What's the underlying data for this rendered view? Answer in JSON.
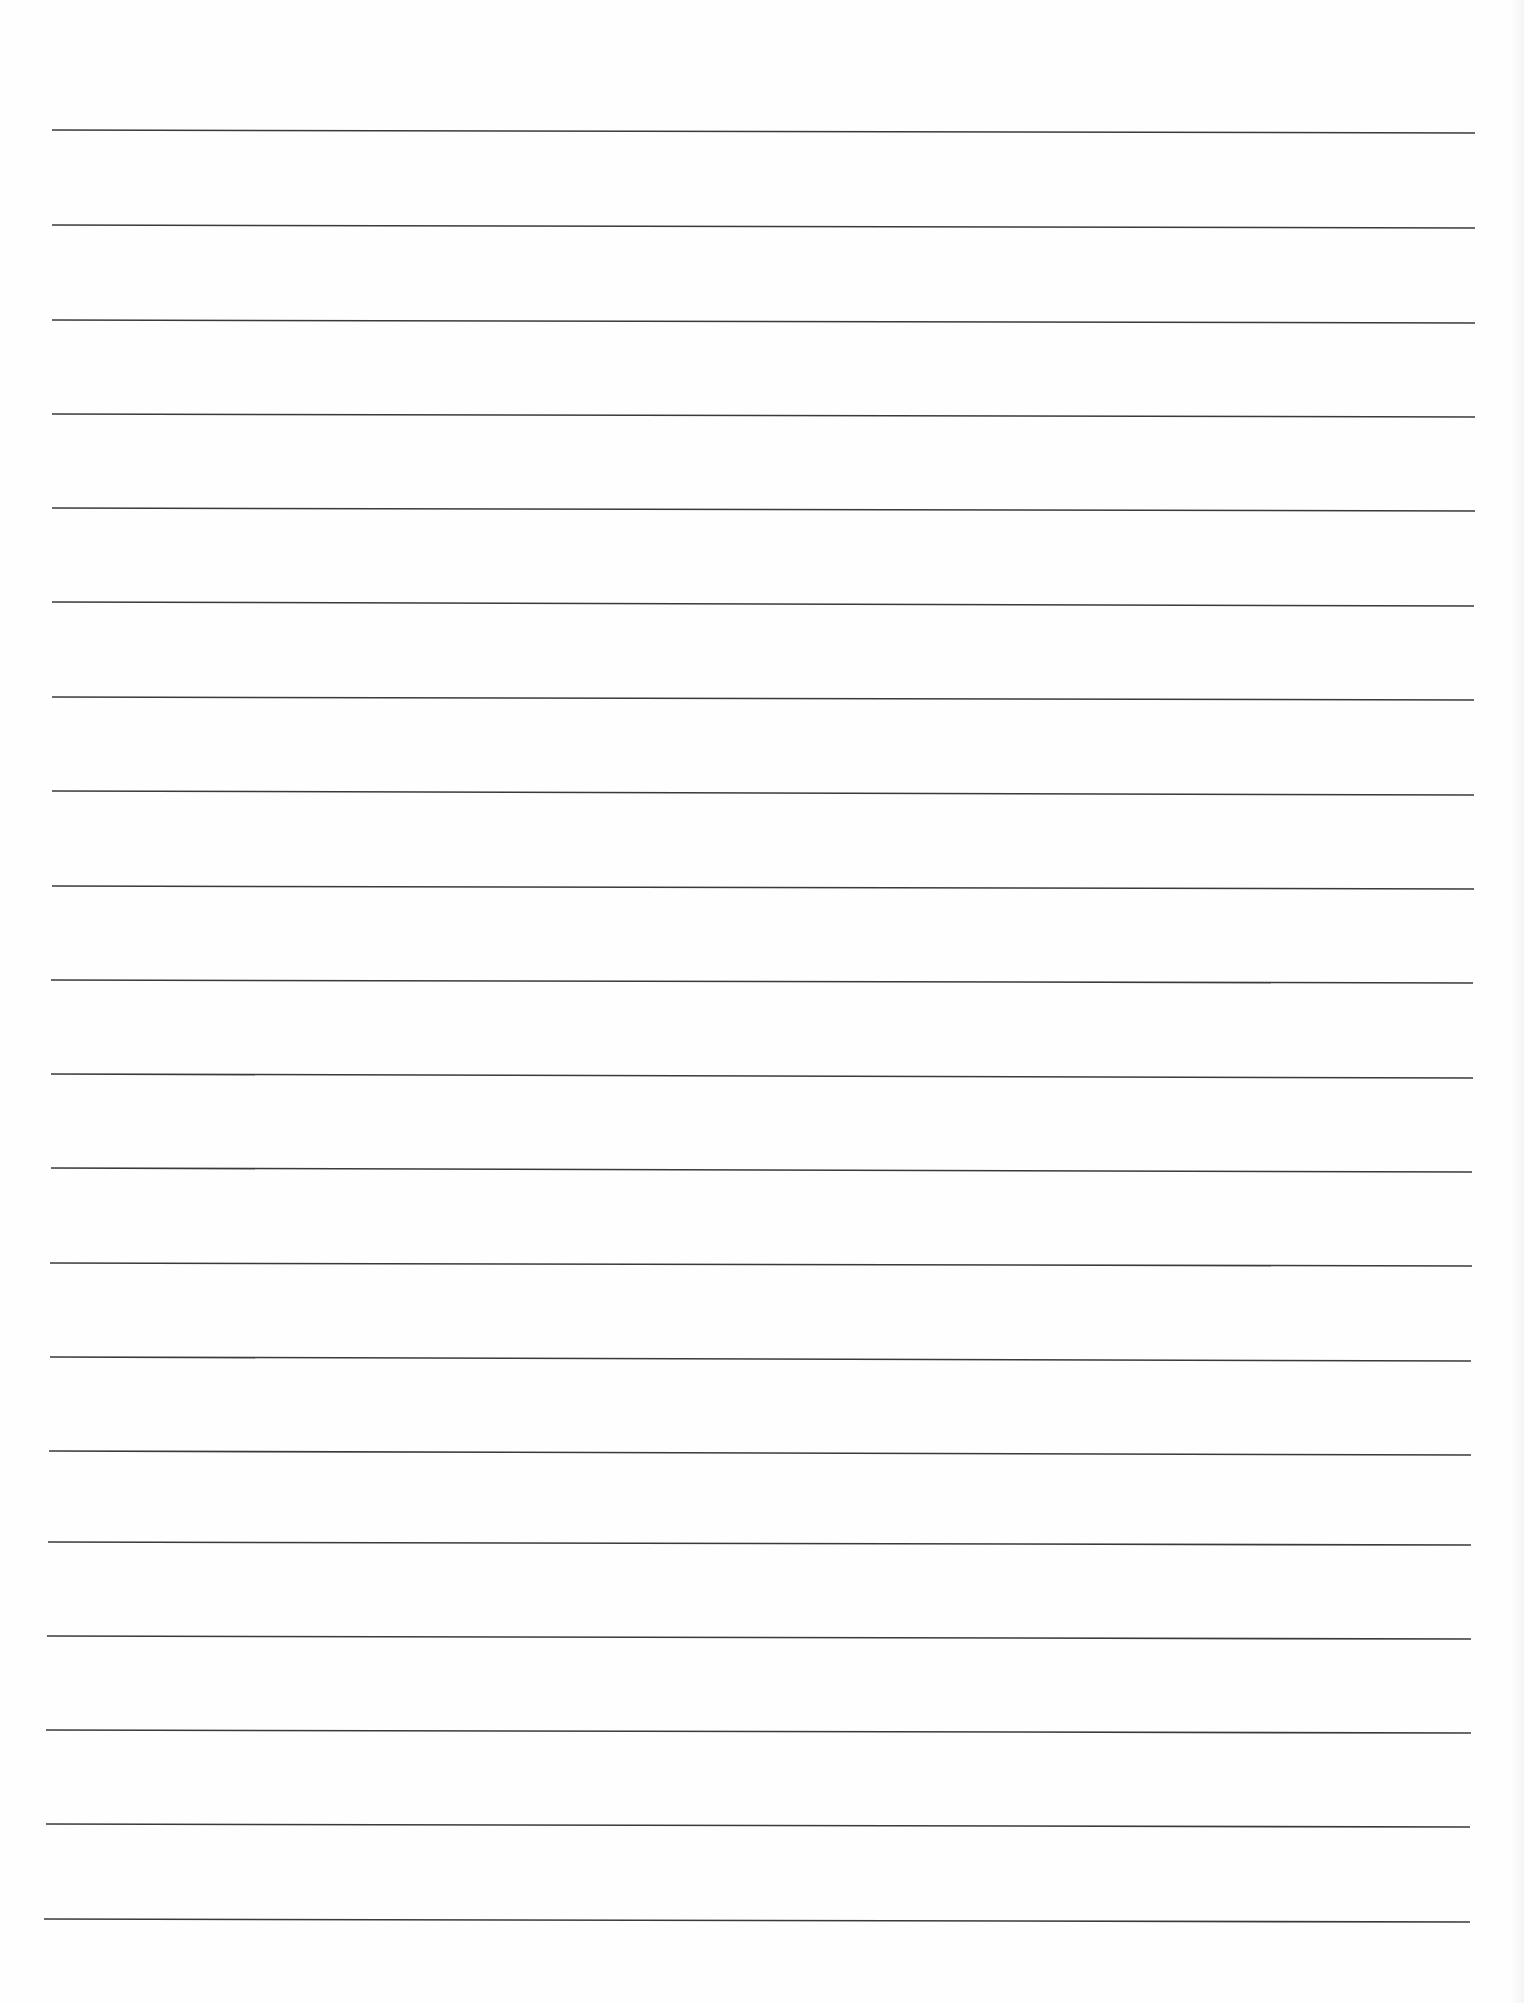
{
  "page": {
    "type": "blank lined paper",
    "background_color": "#fefefe",
    "rule_color": "#3a3a3a",
    "rule_stroke_width": 1.6,
    "rule_count": 20
  },
  "rules": [
    {
      "x1": 52,
      "y1": 130,
      "x2": 1475,
      "y2": 133
    },
    {
      "x1": 52,
      "y1": 225,
      "x2": 1475,
      "y2": 228
    },
    {
      "x1": 52,
      "y1": 320,
      "x2": 1475,
      "y2": 323
    },
    {
      "x1": 52,
      "y1": 414,
      "x2": 1475,
      "y2": 417
    },
    {
      "x1": 52,
      "y1": 508,
      "x2": 1475,
      "y2": 511
    },
    {
      "x1": 52,
      "y1": 602,
      "x2": 1474,
      "y2": 606
    },
    {
      "x1": 52,
      "y1": 697,
      "x2": 1474,
      "y2": 700
    },
    {
      "x1": 52,
      "y1": 791,
      "x2": 1474,
      "y2": 795
    },
    {
      "x1": 52,
      "y1": 886,
      "x2": 1474,
      "y2": 889
    },
    {
      "x1": 51,
      "y1": 980,
      "x2": 1473,
      "y2": 983
    },
    {
      "x1": 51,
      "y1": 1074,
      "x2": 1473,
      "y2": 1078
    },
    {
      "x1": 51,
      "y1": 1168,
      "x2": 1472,
      "y2": 1172
    },
    {
      "x1": 50,
      "y1": 1263,
      "x2": 1472,
      "y2": 1266
    },
    {
      "x1": 50,
      "y1": 1357,
      "x2": 1471,
      "y2": 1361
    },
    {
      "x1": 49,
      "y1": 1451,
      "x2": 1471,
      "y2": 1455
    },
    {
      "x1": 48,
      "y1": 1542,
      "x2": 1242,
      "y2": 1545
    },
    {
      "x1": 47,
      "y1": 1636,
      "x2": 1241,
      "y2": 1639
    },
    {
      "x1": 46,
      "y1": 1730,
      "x2": 1240,
      "y2": 1733
    },
    {
      "x1": 46,
      "y1": 1824,
      "x2": 1239,
      "y2": 1827
    },
    {
      "x1": 44,
      "y1": 1919,
      "x2": 1239,
      "y2": 1922
    }
  ]
}
